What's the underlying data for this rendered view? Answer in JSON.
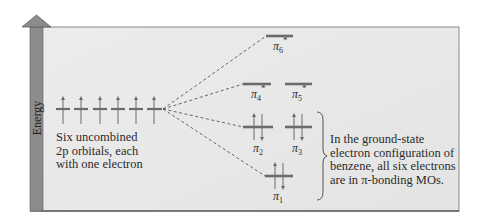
{
  "diagram": {
    "axis": {
      "label": "Energy",
      "direction": "up"
    },
    "atomic_orbitals": {
      "count": 6,
      "type": "2p",
      "electrons_each": 1,
      "description": "Six uncombined 2p orbitals, each with one electron",
      "caption_lines": [
        "Six uncombined",
        "2p orbitals, each",
        "with one electron"
      ]
    },
    "molecular_orbitals": [
      {
        "name": "π6*",
        "base": "π",
        "sub": "6",
        "star": true,
        "type": "antibonding",
        "electrons": 0
      },
      {
        "name": "π4*",
        "base": "π",
        "sub": "4",
        "star": true,
        "type": "antibonding",
        "electrons": 0
      },
      {
        "name": "π5*",
        "base": "π",
        "sub": "5",
        "star": true,
        "type": "antibonding",
        "electrons": 0
      },
      {
        "name": "π2",
        "base": "π",
        "sub": "2",
        "star": false,
        "type": "bonding",
        "electrons": 2
      },
      {
        "name": "π3",
        "base": "π",
        "sub": "3",
        "star": false,
        "type": "bonding",
        "electrons": 2
      },
      {
        "name": "π1",
        "base": "π",
        "sub": "1",
        "star": false,
        "type": "bonding",
        "electrons": 2
      }
    ],
    "annotation": {
      "text": "In the ground-state electron configuration of benzene, all six electrons are in π-bonding MOs.",
      "lines": [
        "In the ground-state",
        "electron configuration of",
        "benzene, all six electrons",
        "are in π-bonding MOs."
      ]
    },
    "colors": {
      "panel_bg": "#e9e9e9",
      "panel_border": "#8a8a8a",
      "axis_bar": "#8c8c8c",
      "level_line": "#6b6b6b",
      "arrow": "#6b6b6b",
      "dashed": "#555555",
      "text": "#2b2b2b"
    }
  }
}
